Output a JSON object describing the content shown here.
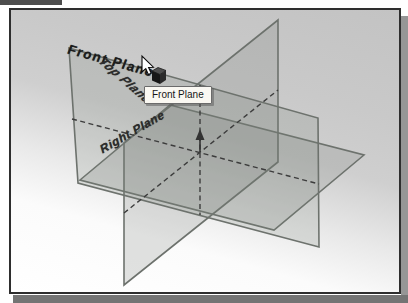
{
  "viewport": {
    "description": "CAD graphics area showing three default reference planes",
    "colors": {
      "frame_border": "#2e2e2e",
      "background_top": "#c3c3c3",
      "background_bottom": "#ffffff",
      "plane_stroke": "#6d726d",
      "plane_fill": "rgba(122,128,122,0.22)",
      "dashed_axis": "#3c3c3c",
      "shadow": "#747474",
      "tab": "#4d4d4d"
    }
  },
  "labels": {
    "front_plane": "Front Plane",
    "top_plane": "Top Plane",
    "right_plane": "Right Plane"
  },
  "tooltip": {
    "text": "Front Plane"
  },
  "icons": {
    "cursor": "arrow-cursor-icon",
    "cursor_badge": "plane-badge-icon",
    "origin": "origin-up-arrow-icon"
  }
}
